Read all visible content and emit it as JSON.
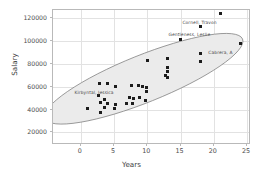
{
  "chart_data": {
    "type": "scatter",
    "title": "",
    "xlabel": "Years",
    "ylabel": "Salary",
    "xlim": [
      -4.2,
      25.6
    ],
    "ylim": [
      9000,
      127000
    ],
    "xticks": [
      0,
      5,
      10,
      15,
      20,
      25
    ],
    "yticks": [
      20000,
      40000,
      60000,
      80000,
      100000,
      120000
    ],
    "xtick_labels": [
      "0",
      "5",
      "10",
      "15",
      "20",
      "25"
    ],
    "ytick_labels": [
      "20000",
      "40000",
      "60000",
      "80000",
      "100000",
      "120000"
    ],
    "grid": true,
    "legend": null,
    "marker": "square",
    "marker_color": "#1c1c1c",
    "ellipse": {
      "label": "confidence-ellipse",
      "fill_color": "#ebebeb",
      "stroke_color": "#7d7d7d",
      "center_x": 9.6,
      "center_y": 66000,
      "semi_major": 16.2,
      "semi_minor": 3.6,
      "angle_deg": -22
    },
    "points": [
      {
        "x": 21.0,
        "y": 124000
      },
      {
        "x": 18.0,
        "y": 113000
      },
      {
        "x": 24.0,
        "y": 98000
      },
      {
        "x": 15.0,
        "y": 101000
      },
      {
        "x": 18.0,
        "y": 89000
      },
      {
        "x": 18.0,
        "y": 82000
      },
      {
        "x": 13.0,
        "y": 85000
      },
      {
        "x": 10.0,
        "y": 82500
      },
      {
        "x": 13.0,
        "y": 77000
      },
      {
        "x": 13.0,
        "y": 73000
      },
      {
        "x": 12.8,
        "y": 69500
      },
      {
        "x": 13.1,
        "y": 68000
      },
      {
        "x": 2.8,
        "y": 62500
      },
      {
        "x": 4.0,
        "y": 62500
      },
      {
        "x": 5.2,
        "y": 60500
      },
      {
        "x": 7.6,
        "y": 61000
      },
      {
        "x": 8.6,
        "y": 61000
      },
      {
        "x": 9.2,
        "y": 60500
      },
      {
        "x": 9.9,
        "y": 59000
      },
      {
        "x": 9.9,
        "y": 56000
      },
      {
        "x": 2.6,
        "y": 52000
      },
      {
        "x": 3.5,
        "y": 49000
      },
      {
        "x": 7.3,
        "y": 50500
      },
      {
        "x": 7.9,
        "y": 49500
      },
      {
        "x": 8.8,
        "y": 50500
      },
      {
        "x": 9.7,
        "y": 47500
      },
      {
        "x": 2.9,
        "y": 46500
      },
      {
        "x": 4.0,
        "y": 45500
      },
      {
        "x": 5.2,
        "y": 44000
      },
      {
        "x": 6.8,
        "y": 45500
      },
      {
        "x": 7.8,
        "y": 45500
      },
      {
        "x": 5.1,
        "y": 40500
      },
      {
        "x": 3.5,
        "y": 41500
      },
      {
        "x": 1.0,
        "y": 41000
      },
      {
        "x": 3.0,
        "y": 37000
      }
    ],
    "annotations": [
      {
        "label": "Cornell, Travon",
        "x": 21.0,
        "y": 124000,
        "dx": -38,
        "dy": 7
      },
      {
        "label": "Gentleness, Leslie",
        "x": 18.0,
        "y": 113000,
        "dx": -32,
        "dy": 6
      },
      {
        "label": "Cabrera, A",
        "x": 24.0,
        "y": 98000,
        "dx": -32,
        "dy": 7
      },
      {
        "label": "Kirbyntal, Jessica",
        "x": 4.0,
        "y": 62500,
        "dx": -33,
        "dy": 6
      }
    ]
  }
}
